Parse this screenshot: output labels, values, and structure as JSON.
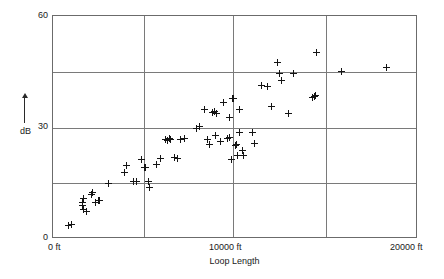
{
  "chart_data": {
    "type": "scatter",
    "title": "",
    "xlabel": "Loop Length",
    "ylabel": "dB",
    "xlim": [
      0,
      20000
    ],
    "ylim": [
      0,
      60
    ],
    "grid": true,
    "legend": null,
    "x_unit": "ft",
    "y_unit": "dB",
    "xticks": [
      0,
      10000,
      20000
    ],
    "xtick_labels": [
      "0 ft",
      "10000 ft",
      "20000 ft"
    ],
    "yticks": [
      0,
      30,
      60
    ],
    "ytick_labels": [
      "0",
      "30",
      "60"
    ],
    "x_gridlines": [
      0,
      5000,
      10000,
      15000,
      20000
    ],
    "y_gridlines": [
      0,
      15,
      30,
      45,
      60
    ],
    "marker": "plus",
    "marker_color": "#141414",
    "grid_color": "#7a7a7a",
    "points": [
      [
        850,
        3.0
      ],
      [
        1000,
        3.5
      ],
      [
        1600,
        8.5
      ],
      [
        1650,
        9.5
      ],
      [
        1700,
        10.5
      ],
      [
        1700,
        7.5
      ],
      [
        1850,
        6.8
      ],
      [
        2100,
        11.5
      ],
      [
        2150,
        12.0
      ],
      [
        2350,
        9.5
      ],
      [
        2500,
        9.8
      ],
      [
        2550,
        10.0
      ],
      [
        3050,
        14.5
      ],
      [
        3950,
        17.5
      ],
      [
        4050,
        19.5
      ],
      [
        4450,
        15.2
      ],
      [
        4600,
        15.0
      ],
      [
        4900,
        21.0
      ],
      [
        5050,
        19.0
      ],
      [
        5100,
        18.8
      ],
      [
        5250,
        15.2
      ],
      [
        5300,
        13.5
      ],
      [
        5700,
        19.8
      ],
      [
        5950,
        21.3
      ],
      [
        6200,
        26.5
      ],
      [
        6300,
        26.3
      ],
      [
        6400,
        26.8
      ],
      [
        6500,
        26.5
      ],
      [
        6700,
        21.5
      ],
      [
        6850,
        21.3
      ],
      [
        7050,
        26.6
      ],
      [
        7250,
        26.8
      ],
      [
        7900,
        29.5
      ],
      [
        8050,
        30.0
      ],
      [
        8350,
        34.5
      ],
      [
        8500,
        26.5
      ],
      [
        8600,
        25.0
      ],
      [
        8800,
        33.8
      ],
      [
        8900,
        34.0
      ],
      [
        8950,
        27.5
      ],
      [
        9000,
        33.5
      ],
      [
        9250,
        26.0
      ],
      [
        9400,
        36.5
      ],
      [
        9600,
        26.8
      ],
      [
        9700,
        27.0
      ],
      [
        9750,
        32.5
      ],
      [
        9900,
        37.5
      ],
      [
        9950,
        37.6
      ],
      [
        10050,
        24.8
      ],
      [
        10100,
        25.0
      ],
      [
        10150,
        22.0
      ],
      [
        10250,
        28.5
      ],
      [
        10300,
        34.5
      ],
      [
        10450,
        23.5
      ],
      [
        10500,
        22.2
      ],
      [
        9850,
        21.0
      ],
      [
        11000,
        28.5
      ],
      [
        11100,
        25.3
      ],
      [
        11500,
        41.0
      ],
      [
        11800,
        40.8
      ],
      [
        12050,
        35.5
      ],
      [
        12350,
        47.5
      ],
      [
        12500,
        44.5
      ],
      [
        12600,
        42.5
      ],
      [
        12950,
        33.5
      ],
      [
        13250,
        44.5
      ],
      [
        14300,
        38.0
      ],
      [
        14400,
        38.2
      ],
      [
        14450,
        38.3
      ],
      [
        14500,
        50.0
      ],
      [
        15900,
        45.0
      ],
      [
        18400,
        46.0
      ]
    ]
  }
}
